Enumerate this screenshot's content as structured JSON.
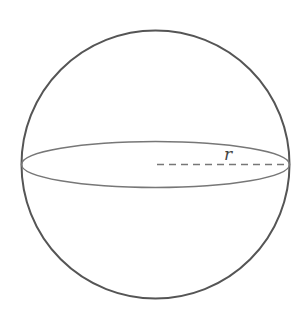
{
  "figure": {
    "type": "sphere",
    "label_radius": "r",
    "stroke_color": "#555555",
    "background": "#ffffff",
    "sphere": {
      "cx": 155.5,
      "cy": 164.5,
      "r": 134
    },
    "equator": {
      "cx": 155.5,
      "cy": 164.5,
      "rx": 134,
      "ry": 23
    },
    "radius_line": {
      "x1": 157,
      "y1": 164.5,
      "x2": 289,
      "y2": 164.5,
      "style": "dashed"
    }
  }
}
